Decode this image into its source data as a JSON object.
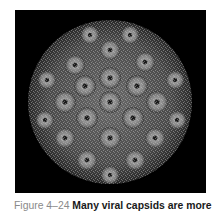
{
  "figure": {
    "image_alt": "Icosahedral viral capsid composed of protein subunits (capsomeres)",
    "caption_label": "Figure 4–24",
    "caption_title": "Many viral capsids are more"
  }
}
